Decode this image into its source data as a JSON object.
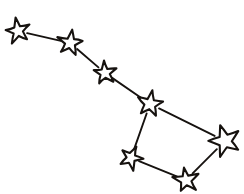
{
  "figure": {
    "style": "hand-drawn black outline stars on white background",
    "width": 244,
    "height": 194,
    "background_color": "#ffffff",
    "ink_color": "#16120f"
  },
  "chart_data": {
    "type": "scatter",
    "xlabel": "",
    "ylabel": "",
    "xlim": [
      0,
      244
    ],
    "ylim": [
      0,
      194
    ],
    "grid": false,
    "legend": "none",
    "points": [
      {
        "name": "star-handle-tip",
        "x": 18,
        "y": 31,
        "radius": 13,
        "rotation": -12,
        "points": 5
      },
      {
        "name": "star-handle-mid",
        "x": 70,
        "y": 43,
        "radius": 13,
        "rotation": 8,
        "points": 5
      },
      {
        "name": "star-handle-base",
        "x": 105,
        "y": 73,
        "radius": 12,
        "rotation": -6,
        "points": 5
      },
      {
        "name": "star-bowl-top-left",
        "x": 150,
        "y": 104,
        "radius": 14,
        "rotation": 10,
        "points": 5
      },
      {
        "name": "star-bowl-top-right",
        "x": 225,
        "y": 141,
        "radius": 16,
        "rotation": -18,
        "points": 5
      },
      {
        "name": "star-bowl-bot-left",
        "x": 131,
        "y": 158,
        "radius": 12,
        "rotation": 24,
        "points": 5
      },
      {
        "name": "star-bowl-bot-right",
        "x": 186,
        "y": 180,
        "radius": 13,
        "rotation": -8,
        "points": 5
      }
    ],
    "edges": [
      {
        "name": "edge-handle-tip-to-mid",
        "from": "star-handle-tip",
        "to": "star-handle-mid"
      },
      {
        "name": "edge-handle-mid-to-base",
        "from": "star-handle-mid",
        "to": "star-handle-base"
      },
      {
        "name": "edge-handle-base-to-bowl",
        "from": "star-handle-base",
        "to": "star-bowl-top-left"
      },
      {
        "name": "edge-bowl-top-left-to-right",
        "from": "star-bowl-top-left",
        "to": "star-bowl-top-right"
      },
      {
        "name": "edge-bowl-top-left-down",
        "from": "star-bowl-top-left",
        "to": "star-bowl-bot-left"
      },
      {
        "name": "edge-bowl-bot-left-to-right",
        "from": "star-bowl-bot-left",
        "to": "star-bowl-bot-right"
      },
      {
        "name": "edge-bowl-bot-right-to-top",
        "from": "star-bowl-bot-right",
        "to": "star-bowl-top-right"
      }
    ]
  }
}
